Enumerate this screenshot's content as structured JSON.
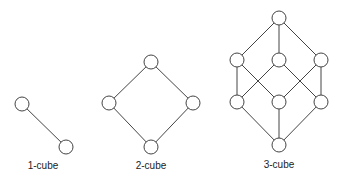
{
  "diagrams": [
    {
      "label": "1-cube",
      "label_pos": [
        43,
        169
      ],
      "nodes": [
        [
          22,
          104
        ],
        [
          66,
          147
        ]
      ],
      "edges": [
        [
          0,
          1
        ]
      ]
    },
    {
      "label": "2-cube",
      "label_pos": [
        151,
        169
      ],
      "nodes": [
        [
          151,
          62
        ],
        [
          109,
          103
        ],
        [
          193,
          103
        ],
        [
          151,
          147
        ]
      ],
      "edges": [
        [
          0,
          1
        ],
        [
          0,
          2
        ],
        [
          1,
          3
        ],
        [
          2,
          3
        ]
      ]
    },
    {
      "label": "3-cube",
      "label_pos": [
        279,
        168
      ],
      "nodes": [
        [
          279,
          18
        ],
        [
          237,
          60
        ],
        [
          279,
          60
        ],
        [
          321,
          60
        ],
        [
          237,
          102
        ],
        [
          279,
          102
        ],
        [
          321,
          102
        ],
        [
          279,
          145
        ]
      ],
      "edges": [
        [
          0,
          1
        ],
        [
          0,
          2
        ],
        [
          0,
          3
        ],
        [
          1,
          4
        ],
        [
          1,
          5
        ],
        [
          2,
          4
        ],
        [
          2,
          6
        ],
        [
          3,
          5
        ],
        [
          3,
          6
        ],
        [
          4,
          7
        ],
        [
          5,
          7
        ],
        [
          6,
          7
        ]
      ]
    }
  ],
  "style": {
    "node_radius": 7,
    "stroke_color": "#444444",
    "background": "#ffffff"
  }
}
